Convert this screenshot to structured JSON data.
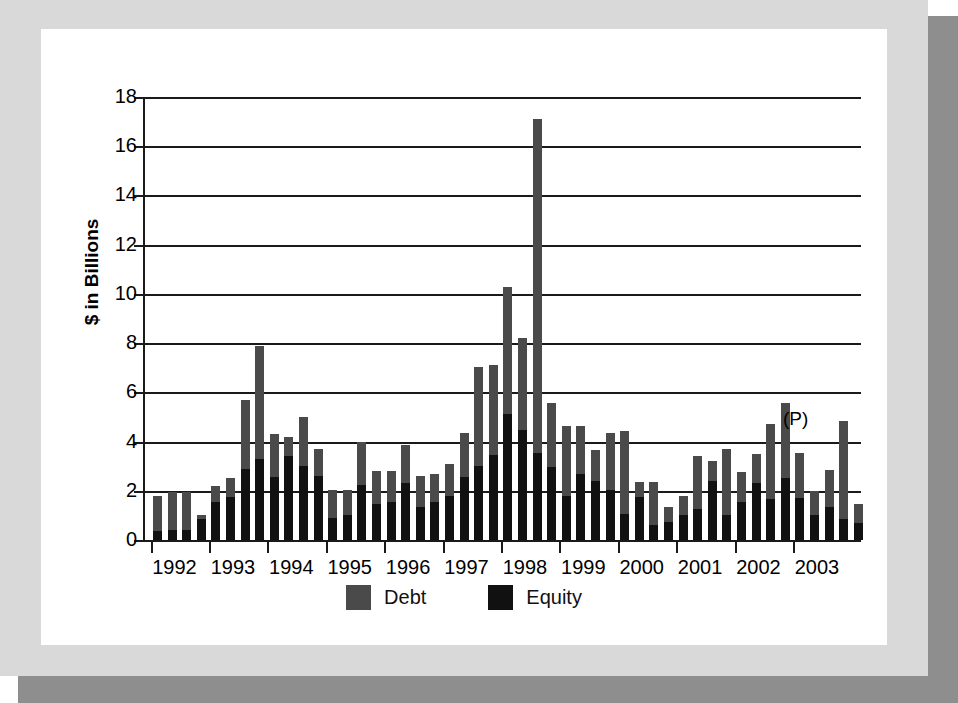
{
  "chart_data": {
    "type": "bar",
    "title": "",
    "subtitle": "",
    "xlabel": "",
    "ylabel": "$ in Billions",
    "ylim": [
      0,
      18
    ],
    "ytick_labels": [
      "0",
      "2",
      "4",
      "6",
      "8",
      "10",
      "12",
      "14",
      "16",
      "18"
    ],
    "ytick_values": [
      0,
      2,
      4,
      6,
      8,
      10,
      12,
      14,
      16,
      18
    ],
    "grid": true,
    "stacked": true,
    "legend_position": "bottom",
    "annotations": [
      {
        "text": "(P)",
        "meaning": "preliminary",
        "near_x": "2004 Q1"
      }
    ],
    "xtick_labels": [
      "1992",
      "1993",
      "1994",
      "1995",
      "1996",
      "1997",
      "1998",
      "1999",
      "2000",
      "2001",
      "2002",
      "2003"
    ],
    "categories": [
      "1992 Q1",
      "1992 Q2",
      "1992 Q3",
      "1992 Q4",
      "1993 Q1",
      "1993 Q2",
      "1993 Q3",
      "1993 Q4",
      "1994 Q1",
      "1994 Q2",
      "1994 Q3",
      "1994 Q4",
      "1995 Q1",
      "1995 Q2",
      "1995 Q3",
      "1995 Q4",
      "1996 Q1",
      "1996 Q2",
      "1996 Q3",
      "1996 Q4",
      "1997 Q1",
      "1997 Q2",
      "1997 Q3",
      "1997 Q4",
      "1998 Q1",
      "1998 Q2",
      "1998 Q3",
      "1998 Q4",
      "1999 Q1",
      "1999 Q2",
      "1999 Q3",
      "1999 Q4",
      "2000 Q1",
      "2000 Q2",
      "2000 Q3",
      "2000 Q4",
      "2001 Q1",
      "2001 Q2",
      "2001 Q3",
      "2001 Q4",
      "2002 Q1",
      "2002 Q2",
      "2002 Q3",
      "2002 Q4",
      "2003 Q1",
      "2003 Q2",
      "2003 Q3",
      "2003 Q4",
      "2004 Q1 (P)"
    ],
    "series": [
      {
        "name": "Equity",
        "color": "#111111",
        "values": [
          0.35,
          0.4,
          0.4,
          0.85,
          1.55,
          1.75,
          2.9,
          3.3,
          2.55,
          3.4,
          3.0,
          2.6,
          0.9,
          1.0,
          2.25,
          1.45,
          1.55,
          2.3,
          1.35,
          1.55,
          1.8,
          2.55,
          3.0,
          3.45,
          5.1,
          4.45,
          3.55,
          2.95,
          1.8,
          2.7,
          2.4,
          2.05,
          1.05,
          1.75,
          0.6,
          0.75,
          1.0,
          1.25,
          2.4,
          1.0,
          1.55,
          2.3,
          1.65,
          2.5,
          1.7,
          1.0,
          1.35,
          0.85,
          0.7
        ]
      },
      {
        "name": "Debt",
        "color": "#4a4a4a",
        "values": [
          1.45,
          1.55,
          1.55,
          0.15,
          0.65,
          0.75,
          2.8,
          4.6,
          1.75,
          0.8,
          2.0,
          1.1,
          1.15,
          1.05,
          1.75,
          1.35,
          1.25,
          1.55,
          1.25,
          1.15,
          1.3,
          1.8,
          4.05,
          3.65,
          5.2,
          3.75,
          13.55,
          2.6,
          2.85,
          1.95,
          1.25,
          2.3,
          3.4,
          0.6,
          1.75,
          0.6,
          0.8,
          2.15,
          0.8,
          2.7,
          1.2,
          1.2,
          3.05,
          3.05,
          1.85,
          1.0,
          1.5,
          4.0,
          0.75
        ]
      }
    ],
    "totals": [
      1.8,
      1.95,
      1.95,
      1.0,
      2.2,
      2.5,
      5.7,
      7.9,
      4.3,
      4.2,
      5.0,
      3.7,
      2.05,
      2.05,
      4.0,
      2.8,
      2.8,
      3.85,
      2.6,
      2.7,
      3.1,
      4.35,
      7.05,
      7.1,
      10.3,
      8.2,
      17.1,
      5.55,
      4.65,
      4.65,
      3.65,
      4.35,
      4.45,
      2.35,
      2.35,
      1.35,
      1.8,
      3.4,
      3.2,
      3.7,
      2.75,
      3.5,
      4.7,
      5.55,
      3.55,
      2.0,
      2.85,
      4.85,
      1.45
    ]
  },
  "axis": {
    "y_title": "$ in Billions",
    "y_ticks": [
      "18",
      "16",
      "14",
      "12",
      "10",
      "8",
      "6",
      "4",
      "2",
      "0"
    ],
    "x_ticks": [
      "1992",
      "1993",
      "1994",
      "1995",
      "1996",
      "1997",
      "1998",
      "1999",
      "2000",
      "2001",
      "2002",
      "2003"
    ],
    "preliminary_note": "(P)"
  },
  "legend": {
    "items": [
      {
        "label": "Debt",
        "color": "#4a4a4a"
      },
      {
        "label": "Equity",
        "color": "#111111"
      }
    ]
  },
  "colors": {
    "debt": "#4a4a4a",
    "equity": "#111111",
    "axis": "#1a1a1a",
    "card": "#ffffff",
    "frame": "#d9d9d9",
    "shadow": "#8e8e8e"
  }
}
